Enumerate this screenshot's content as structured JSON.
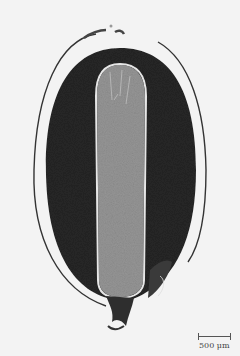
{
  "image": {
    "subject": "seed longitudinal section micrograph",
    "colors": {
      "background": "#f3f3f3",
      "outer_tissue": "#2a2a2a",
      "inner_tissue": "#9a9a9a",
      "seed_coat_line": "#333333",
      "inner_border": "#e8e8e8"
    }
  },
  "scale_bar": {
    "label": "500 μm"
  }
}
